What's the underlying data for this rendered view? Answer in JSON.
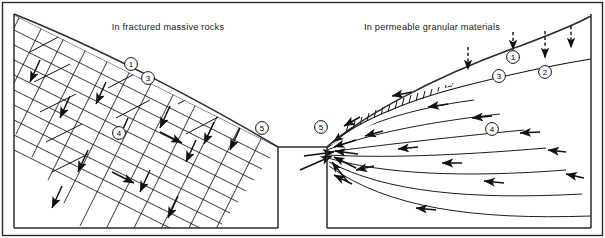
{
  "figure": {
    "kind": "seepage-flow-net-comparison-diagram",
    "background_color": "#ffffff",
    "ink_color": "#111111",
    "frame": {
      "stroke": "#2b2b2b",
      "width": 605,
      "height": 238
    }
  },
  "panels": [
    {
      "id": "left",
      "title": "In fractured massive rocks",
      "title_x": 168,
      "title_y": 30,
      "description": "Slope cross-section with an orthogonal flow net of intersecting equipotential and flow lines in jointed rock",
      "callouts": [
        {
          "label": "1",
          "x": 131,
          "y": 64
        },
        {
          "label": "3",
          "x": 148,
          "y": 78
        },
        {
          "label": "4",
          "x": 119,
          "y": 133
        },
        {
          "label": "5",
          "x": 262,
          "y": 128
        }
      ]
    },
    {
      "id": "right",
      "title": "In permeable granular materials",
      "title_x": 432,
      "title_y": 30,
      "description": "Slope cross-section with curvilinear seepage flow lines converging at the toe beneath a hatched phreatic surface",
      "callouts": [
        {
          "label": "1",
          "x": 513,
          "y": 57
        },
        {
          "label": "3",
          "x": 499,
          "y": 76
        },
        {
          "label": "2",
          "x": 545,
          "y": 72
        },
        {
          "label": "4",
          "x": 492,
          "y": 129
        },
        {
          "label": "5",
          "x": 321,
          "y": 127
        }
      ],
      "infiltration_arrows": {
        "style": "dashed-downward",
        "count": 4,
        "x_positions": [
          468,
          513,
          545,
          571
        ]
      },
      "phreatic_surface": {
        "style": "hatched-curve",
        "label": "water-table"
      }
    }
  ],
  "legend_keys": [
    "1",
    "2",
    "3",
    "4",
    "5"
  ]
}
